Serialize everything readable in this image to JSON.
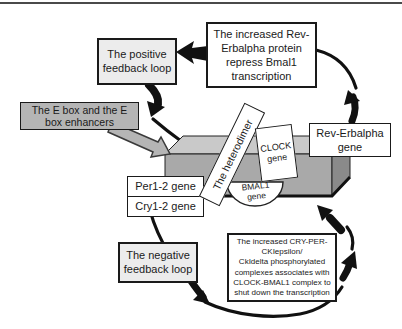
{
  "boxes": {
    "positive_feedback": {
      "lines": [
        "The positive",
        "feedback loop"
      ]
    },
    "rev_erbalpha_protein": {
      "lines": [
        "The increased Rev-",
        "Erbalpha protein",
        "repress Bmal1",
        "transcription"
      ]
    },
    "e_box_enhancers": {
      "lines": [
        "The E box and the E",
        "box enhancers"
      ]
    },
    "per_gene": {
      "label": "Per1-2 gene"
    },
    "cry_gene": {
      "label": "Cry1-2 gene"
    },
    "rev_erbalpha_gene": {
      "lines": [
        "Rev-Erbalpha",
        "gene"
      ]
    },
    "negative_feedback": {
      "lines": [
        "The negative",
        "feedback loop"
      ]
    },
    "cry_per_complex": {
      "lines": [
        "The increased CRY-PER-",
        "CKIepsilon/",
        "CkIdelta phosphorylated",
        "complexes associates with",
        "CLOCK-BMAL1 complex to",
        "shut down the transcription"
      ]
    },
    "heterodimer": {
      "label": "The heterodimer"
    },
    "clock_gene": {
      "lines": [
        "CLOCK",
        "gene"
      ]
    },
    "bmal1_gene": {
      "lines": [
        "BMAL1",
        "gene"
      ]
    }
  },
  "colors": {
    "arrow_black": "#111111",
    "box_border": "#1a1a1a",
    "light_box_fill": "#ececec",
    "gray_label_fill": "#b5b5b5",
    "slab_front": "#a9a9a9",
    "slab_top": "#c9c9c9",
    "slab_side": "#8a8a8a"
  }
}
